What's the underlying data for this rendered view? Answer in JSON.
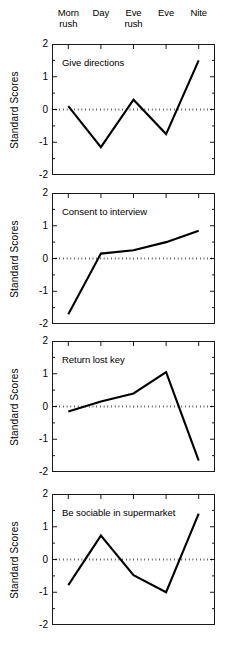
{
  "figure": {
    "width": 230,
    "height": 650,
    "y_axis_title": "Standard Scores",
    "categories": [
      "Morn\nrush",
      "Day",
      "Eve\nrush",
      "Eve",
      "Nite"
    ],
    "y_tick_labels": [
      "2",
      "1",
      "0",
      "-1",
      "-2"
    ],
    "line_color": "#000000",
    "zero_line_color": "#000000",
    "frame_color": "#1a1a1a"
  },
  "chart_data": [
    {
      "type": "line",
      "title": "Give directions",
      "categories": [
        "Morn rush",
        "Day",
        "Eve rush",
        "Eve",
        "Nite"
      ],
      "values": [
        0.1,
        -1.15,
        0.3,
        -0.75,
        1.5
      ],
      "xlabel": "",
      "ylabel": "Standard Scores",
      "ylim": [
        -2,
        2
      ],
      "yticks": [
        -2,
        -1,
        0,
        1,
        2
      ],
      "grid": false,
      "legend": "none",
      "annotations": [
        "dotted reference line at y = 0"
      ]
    },
    {
      "type": "line",
      "title": "Consent to interview",
      "categories": [
        "Morn rush",
        "Day",
        "Eve rush",
        "Eve",
        "Nite"
      ],
      "values": [
        -1.7,
        0.15,
        0.25,
        0.5,
        0.85
      ],
      "xlabel": "",
      "ylabel": "Standard Scores",
      "ylim": [
        -2,
        2
      ],
      "yticks": [
        -2,
        -1,
        0,
        1,
        2
      ],
      "grid": false,
      "legend": "none",
      "annotations": [
        "dotted reference line at y = 0"
      ]
    },
    {
      "type": "line",
      "title": "Return lost key",
      "categories": [
        "Morn rush",
        "Day",
        "Eve rush",
        "Eve",
        "Nite"
      ],
      "values": [
        -0.15,
        0.15,
        0.4,
        1.05,
        -1.65
      ],
      "xlabel": "",
      "ylabel": "Standard Scores",
      "ylim": [
        -2,
        2
      ],
      "yticks": [
        -2,
        -1,
        0,
        1,
        2
      ],
      "grid": false,
      "legend": "none",
      "annotations": [
        "dotted reference line at y = 0"
      ]
    },
    {
      "type": "line",
      "title": "Be sociable in supermarket",
      "categories": [
        "Morn rush",
        "Day",
        "Eve rush",
        "Eve",
        "Nite"
      ],
      "values": [
        -0.78,
        0.73,
        -0.48,
        -1.0,
        1.4
      ],
      "xlabel": "",
      "ylabel": "Standard Scores",
      "ylim": [
        -2,
        2
      ],
      "yticks": [
        -2,
        -1,
        0,
        1,
        2
      ],
      "grid": false,
      "legend": "none",
      "annotations": [
        "dotted reference line at y = 0"
      ]
    }
  ],
  "panel_geometry": [
    {
      "top": 44,
      "height": 131,
      "title_x": 62,
      "title_y": 57
    },
    {
      "top": 193,
      "height": 131,
      "title_x": 62,
      "title_y": 206
    },
    {
      "top": 341,
      "height": 131,
      "title_x": 62,
      "title_y": 354
    },
    {
      "top": 494,
      "height": 131,
      "title_x": 62,
      "title_y": 507
    }
  ]
}
